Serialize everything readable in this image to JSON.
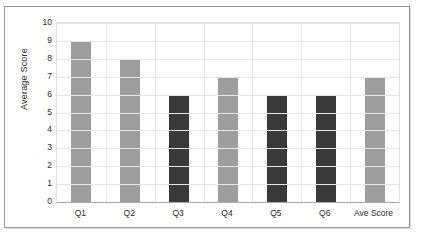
{
  "chart_data": {
    "type": "bar",
    "title": "",
    "xlabel": "",
    "ylabel": "Average Score",
    "categories": [
      "Q1",
      "Q2",
      "Q3",
      "Q4",
      "Q5",
      "Q6",
      "Ave Score"
    ],
    "values": [
      9,
      8,
      6,
      7,
      6,
      6,
      7
    ],
    "bar_colors": [
      "#9e9e9e",
      "#9e9e9e",
      "#3a3a3a",
      "#9e9e9e",
      "#3a3a3a",
      "#3a3a3a",
      "#9e9e9e"
    ],
    "ylim": [
      0,
      10
    ],
    "ytick_labels": [
      "0",
      "1",
      "2",
      "3",
      "4",
      "5",
      "6",
      "7",
      "8",
      "9",
      "10"
    ],
    "ytick_values": [
      0,
      1,
      2,
      3,
      4,
      5,
      6,
      7,
      8,
      9,
      10
    ],
    "grid": "horizontal-and-vertical",
    "legend": "none",
    "series": [
      {
        "name": "Average Score",
        "values": [
          9,
          8,
          6,
          7,
          6,
          6,
          7
        ]
      }
    ]
  },
  "colors": {
    "light_bar": "#9e9e9e",
    "dark_bar": "#3a3a3a",
    "gridline": "#e6e6e6",
    "axis": "#a9a9a9",
    "frame": "#9a9a9a",
    "text": "#2b2b2b",
    "background": "#ffffff"
  }
}
